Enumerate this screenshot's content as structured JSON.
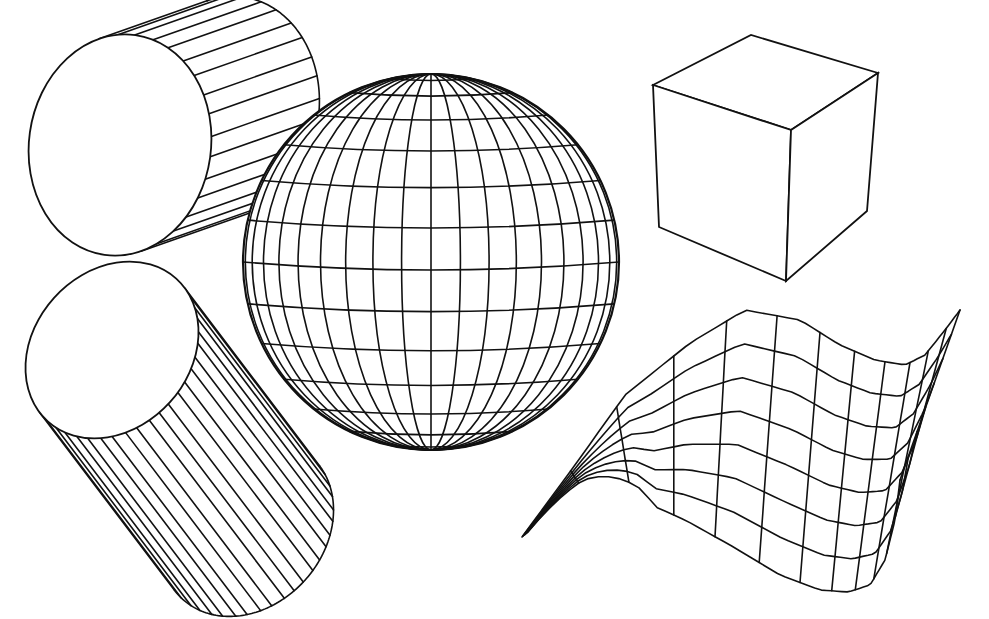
{
  "figure": {
    "background": "#ffffff",
    "line_color": "#111111",
    "shapes": [
      {
        "id": "cylinder-horizontal",
        "type": "cylinder",
        "front_ellipse": {
          "cx": 120,
          "cy": 145,
          "rx": 91,
          "ry": 111,
          "rot": 8
        },
        "axis_offset": {
          "dx": 108,
          "dy": -38
        },
        "rulings": 16
      },
      {
        "id": "cylinder-tilted",
        "type": "cylinder",
        "front_ellipse": {
          "cx": 112,
          "cy": 350,
          "rx": 78,
          "ry": 96,
          "rot": 42
        },
        "axis_offset": {
          "dx": 135,
          "dy": 178
        },
        "rulings": 22
      },
      {
        "id": "sphere",
        "type": "sphere",
        "cx": 431,
        "cy": 262,
        "r": 188,
        "meridians": 20,
        "parallels": 14
      },
      {
        "id": "cube",
        "type": "cube",
        "vertices": {
          "top_left": [
            653,
            85
          ],
          "top_back": [
            751,
            35
          ],
          "top_right": [
            878,
            73
          ],
          "top_front": [
            791,
            130
          ],
          "bottom_left": [
            659,
            227
          ],
          "bottom_front": [
            786,
            281
          ],
          "bottom_right": [
            867,
            211
          ]
        }
      },
      {
        "id": "wave-surface",
        "type": "parametric-surface",
        "rows": 7,
        "cols": 12,
        "corners": {
          "back_left": [
            522,
            537
          ],
          "back_right": [
            960,
            310
          ],
          "front_left": [
            575,
            462
          ],
          "front_right": [
            890,
            590
          ]
        }
      }
    ]
  }
}
